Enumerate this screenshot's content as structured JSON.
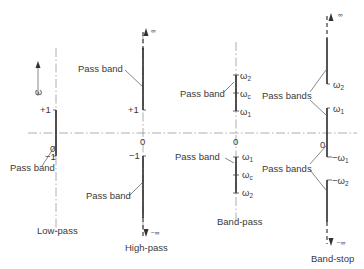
{
  "figure": {
    "axis_symbol": "ω",
    "zero_label": "0",
    "panels": [
      {
        "name": "Low-pass",
        "pass_band_label": "Pass band",
        "marks": {
          "top": "+1",
          "bottom": "−1"
        }
      },
      {
        "name": "High-pass",
        "pass_band_label": "Pass band",
        "marks": {
          "top": "+1",
          "bottom": "−1",
          "plus_inf": "∞",
          "minus_inf": "−∞"
        }
      },
      {
        "name": "Band-pass",
        "pass_band_label": "Pass band",
        "marks": {
          "upper": {
            "w2": "ω",
            "w2_sub": "2",
            "wc": "ω",
            "wc_sub": "c",
            "w1": "ω",
            "w1_sub": "1"
          },
          "lower": {
            "w1": "ω",
            "w1_sub": "1",
            "wc": "ω",
            "wc_sub": "c",
            "w2": "ω",
            "w2_sub": "2"
          }
        }
      },
      {
        "name": "Band-stop",
        "pass_band_label": "Pass bands",
        "marks": {
          "plus_inf": "∞",
          "minus_inf": "−∞",
          "upper": {
            "w2": "ω",
            "w2_sub": "2",
            "w1": "ω",
            "w1_sub": "1"
          },
          "lower": {
            "w1": "−ω",
            "w1_sub": "1",
            "w2": "−ω",
            "w2_sub": "2"
          }
        }
      }
    ]
  }
}
